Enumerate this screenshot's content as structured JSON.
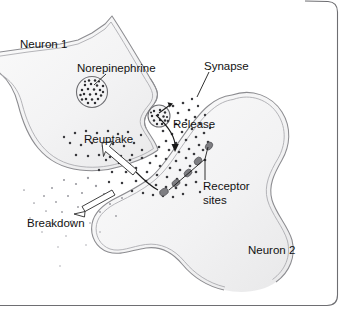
{
  "figure": {
    "background_color": "#ffffff",
    "frame_color": "#6e6e72",
    "membrane_color": "#8c8c90",
    "neurotransmitter_dot_color": "#3a3a3e",
    "receptor_color": "#7e7e82",
    "text_color": "#111111"
  },
  "labels": {
    "neuron1": "Neuron 1",
    "neuron2": "Neuron 2",
    "norepinephrine": "Norepinephrine",
    "synapse": "Synapse",
    "release": "Release",
    "reuptake": "Reuptake",
    "breakdown": "Breakdown",
    "receptor_sites_line1": "Receptor",
    "receptor_sites_line2": "sites"
  },
  "elements": {
    "vesicle_count": 2,
    "receptor_site_count": 5,
    "arrows": [
      {
        "name": "release-arrow",
        "style": "curved-solid",
        "label": "Release"
      },
      {
        "name": "reuptake-arrow",
        "style": "hollow-outline",
        "label": "Reuptake"
      },
      {
        "name": "breakdown-arrow",
        "style": "hollow-outline",
        "label": "Breakdown"
      }
    ]
  }
}
